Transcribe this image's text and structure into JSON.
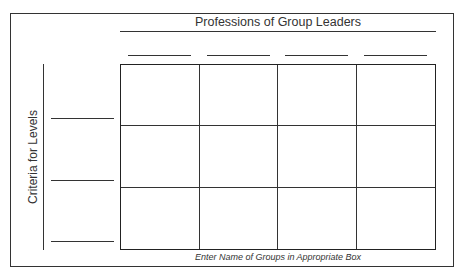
{
  "diagram": {
    "title": "Professions of Group Leaders",
    "y_axis_label": "Criteria for Levels",
    "footnote": "Enter Name of Groups in Appropriate Box",
    "columns": 4,
    "rows": 3,
    "column_header_blanks": [
      "",
      "",
      "",
      ""
    ],
    "row_label_blanks": [
      "",
      "",
      ""
    ],
    "cells": [
      [
        "",
        "",
        "",
        ""
      ],
      [
        "",
        "",
        "",
        ""
      ],
      [
        "",
        "",
        "",
        ""
      ]
    ]
  }
}
